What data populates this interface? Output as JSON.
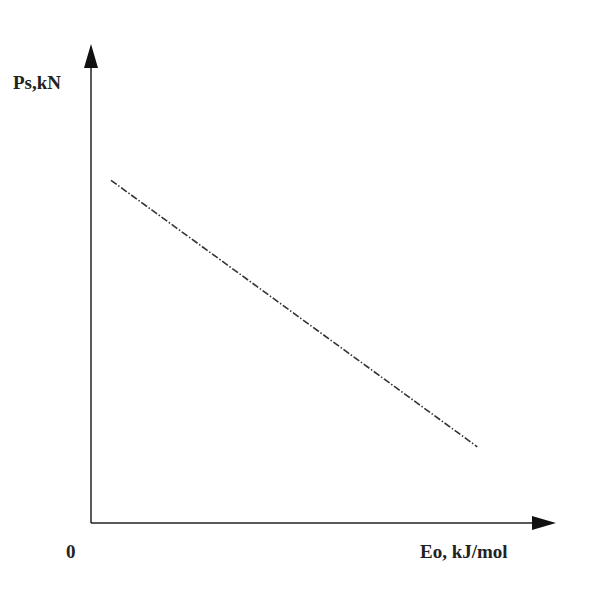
{
  "chart_data": {
    "type": "line",
    "title": "",
    "xlabel": "Eo, kJ/mol",
    "ylabel": "Ps,kN",
    "origin_label": "0",
    "xlim": [
      0,
      1
    ],
    "ylim": [
      0,
      1
    ],
    "grid": false,
    "legend": "none",
    "series": [
      {
        "name": "Ps vs Eo",
        "style": "dash-dot",
        "color": "#333333",
        "x": [
          0.045,
          0.87
        ],
        "y": [
          0.72,
          0.16
        ]
      }
    ],
    "note": "Qualitative schematic; no numeric ticks shown"
  }
}
